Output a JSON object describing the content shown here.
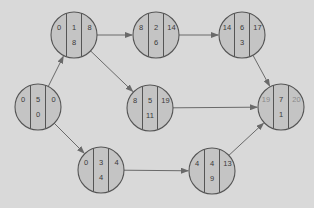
{
  "diagram": {
    "type": "activity-on-node network",
    "colors": {
      "background": "#d9d9d9",
      "node_fill": "#c4c4c4",
      "node_stroke": "#555555",
      "arrow": "#6a6a6a",
      "text": "#3a3a3a",
      "text_faint": "#8a8a8a"
    },
    "nodes": [
      {
        "id": "n0",
        "cx": 38,
        "cy": 107,
        "left": "0",
        "mid": "5",
        "right": "0",
        "bottom": "0",
        "faint_sides": false
      },
      {
        "id": "n1",
        "cx": 74,
        "cy": 35,
        "left": "0",
        "mid": "1",
        "right": "8",
        "bottom": "8",
        "faint_sides": false
      },
      {
        "id": "n2",
        "cx": 156,
        "cy": 35,
        "left": "8",
        "mid": "2",
        "right": "14",
        "bottom": "6",
        "faint_sides": false
      },
      {
        "id": "n6",
        "cx": 242,
        "cy": 35,
        "left": "14",
        "mid": "6",
        "right": "17",
        "bottom": "3",
        "faint_sides": false
      },
      {
        "id": "n5",
        "cx": 150,
        "cy": 108,
        "left": "8",
        "mid": "5",
        "right": "19",
        "bottom": "11",
        "faint_sides": false
      },
      {
        "id": "n7",
        "cx": 281,
        "cy": 107,
        "left": "19",
        "mid": "7",
        "right": "20",
        "bottom": "1",
        "faint_sides": true
      },
      {
        "id": "n3",
        "cx": 101,
        "cy": 170,
        "left": "0",
        "mid": "3",
        "right": "4",
        "bottom": "4",
        "faint_sides": false
      },
      {
        "id": "n4",
        "cx": 212,
        "cy": 171,
        "left": "4",
        "mid": "4",
        "right": "13",
        "bottom": "9",
        "faint_sides": false
      }
    ],
    "edges": [
      {
        "from": "n0",
        "to": "n1"
      },
      {
        "from": "n0",
        "to": "n3"
      },
      {
        "from": "n1",
        "to": "n2"
      },
      {
        "from": "n1",
        "to": "n5"
      },
      {
        "from": "n2",
        "to": "n6"
      },
      {
        "from": "n6",
        "to": "n7"
      },
      {
        "from": "n5",
        "to": "n7"
      },
      {
        "from": "n3",
        "to": "n4"
      },
      {
        "from": "n4",
        "to": "n7"
      }
    ],
    "node_radius": 23
  }
}
